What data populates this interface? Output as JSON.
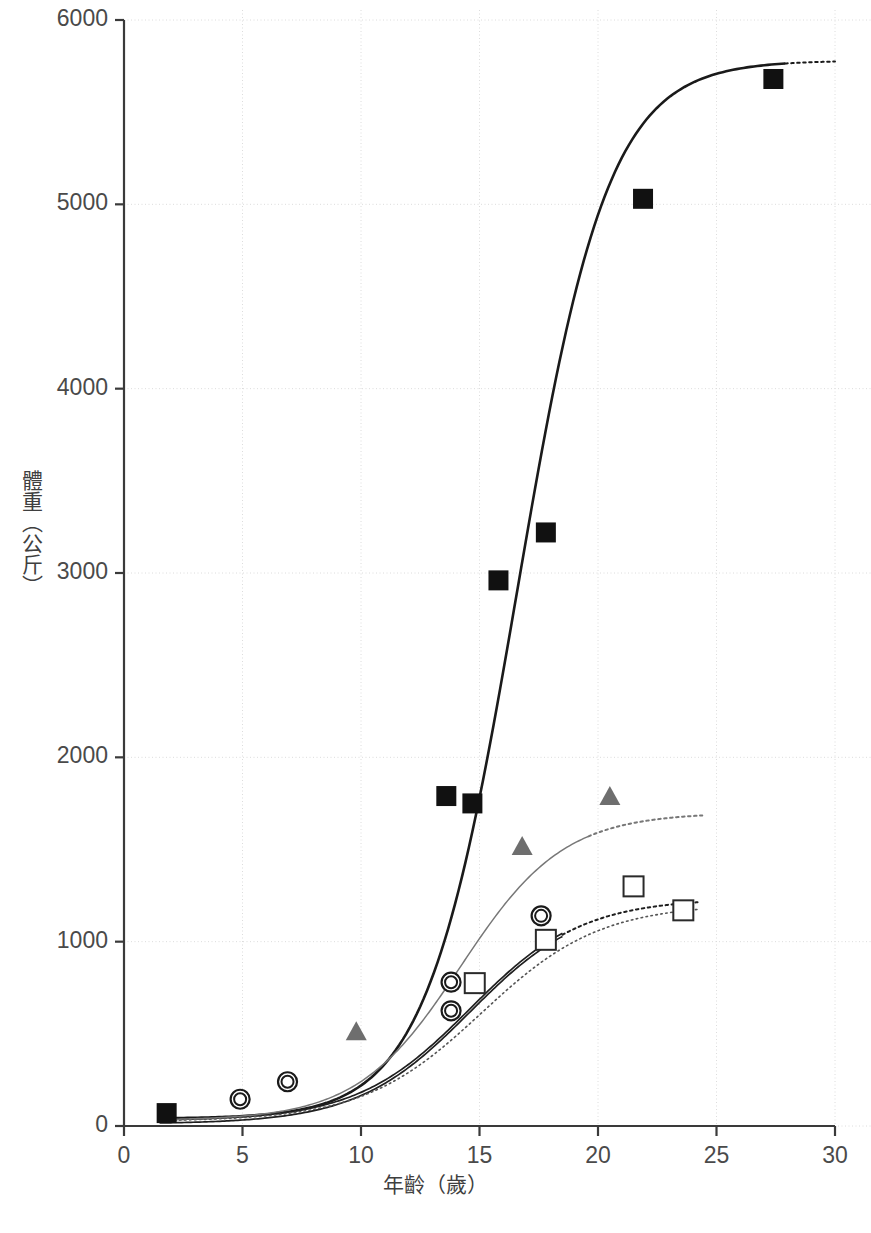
{
  "chart_data": {
    "type": "scatter",
    "title": "",
    "xlabel": "年齡（歲）",
    "ylabel": "體重（公斤）",
    "xlim": [
      0,
      30
    ],
    "ylim": [
      0,
      6000
    ],
    "xticks": [
      0,
      5,
      10,
      15,
      20,
      25,
      30
    ],
    "yticks": [
      0,
      1000,
      2000,
      3000,
      4000,
      5000,
      6000
    ],
    "xtick_labels": [
      "0",
      "5",
      "10",
      "15",
      "20",
      "25",
      "30"
    ],
    "ytick_labels": [
      "0",
      "1000",
      "2000",
      "3000",
      "4000",
      "5000",
      "6000"
    ],
    "grid": true,
    "grid_style": "dotted",
    "legend": "none",
    "series": [
      {
        "name": "filled-square-series",
        "marker": "filled-square",
        "color": "#111111",
        "points": [
          {
            "x": 1.8,
            "y": 70
          },
          {
            "x": 13.6,
            "y": 1790
          },
          {
            "x": 14.7,
            "y": 1750
          },
          {
            "x": 15.8,
            "y": 2960
          },
          {
            "x": 17.8,
            "y": 3220
          },
          {
            "x": 21.9,
            "y": 5030
          },
          {
            "x": 27.4,
            "y": 5680
          }
        ],
        "curve": {
          "style": "solid-thick",
          "color": "#1a1a1a",
          "type": "sigmoid",
          "y0": 40,
          "ymax": 5780,
          "midpoint": 16.6,
          "steepness": 0.52,
          "solid_until": 27.9,
          "dashed_from": 27.9,
          "dashed_to": 30
        }
      },
      {
        "name": "open-circle-series",
        "marker": "open-circle",
        "color": "#1a1a1a",
        "points": [
          {
            "x": 4.9,
            "y": 145
          },
          {
            "x": 6.9,
            "y": 240
          },
          {
            "x": 13.8,
            "y": 780
          },
          {
            "x": 13.8,
            "y": 625
          },
          {
            "x": 17.6,
            "y": 1140
          }
        ],
        "curve": {
          "style": "solid-double",
          "color": "#1f1f1f",
          "type": "sigmoid",
          "y0": 20,
          "ymax": 1235,
          "midpoint": 14.6,
          "steepness": 0.42,
          "solid_until": 18.5,
          "dashed_from": 18.5,
          "dashed_to": 24.2
        }
      },
      {
        "name": "open-square-series",
        "marker": "open-square",
        "color": "#2a2a2a",
        "points": [
          {
            "x": 14.8,
            "y": 775
          },
          {
            "x": 17.8,
            "y": 1010
          },
          {
            "x": 21.5,
            "y": 1300
          },
          {
            "x": 23.6,
            "y": 1170
          }
        ],
        "curve": {
          "style": "dotted",
          "color": "#555555",
          "type": "sigmoid",
          "y0": 25,
          "ymax": 1205,
          "midpoint": 15.1,
          "steepness": 0.4,
          "solid_until": 0,
          "dashed_from": 1.5,
          "dashed_to": 24.2
        }
      },
      {
        "name": "gray-triangle-series",
        "marker": "filled-triangle",
        "color": "#6e6e6e",
        "points": [
          {
            "x": 9.8,
            "y": 505
          },
          {
            "x": 16.8,
            "y": 1510
          },
          {
            "x": 20.5,
            "y": 1780
          }
        ],
        "curve": {
          "style": "solid-thin",
          "color": "#777777",
          "type": "sigmoid",
          "y0": 30,
          "ymax": 1700,
          "midpoint": 14.2,
          "steepness": 0.46,
          "solid_until": 19.6,
          "dashed_from": 19.6,
          "dashed_to": 24.4
        }
      }
    ]
  },
  "axes": {
    "x_label": "年齡（歲）",
    "y_label": "體重（公斤）"
  }
}
